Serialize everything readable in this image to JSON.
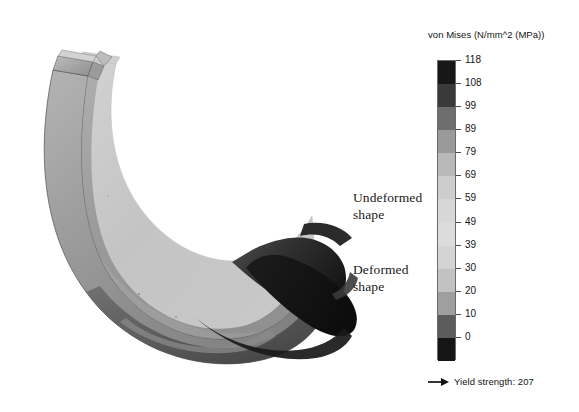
{
  "legend": {
    "title": "von Mises (N/mm^2 (MPa))",
    "scale_values": [
      "118",
      "108",
      "99",
      "89",
      "79",
      "69",
      "59",
      "49",
      "39",
      "30",
      "20",
      "10",
      "0"
    ],
    "band_colors": [
      "#171717",
      "#3a3a3a",
      "#6e6e6e",
      "#9a9a9a",
      "#b9b9b9",
      "#cdcdcd",
      "#d7d7d7",
      "#dcdcdc",
      "#d4d4d4",
      "#c2c2c2",
      "#9f9f9f",
      "#5c5c5c",
      "#151515"
    ],
    "yield": {
      "label": "Yield strength: 207",
      "arrow_icon": "right-arrow-icon"
    }
  },
  "annotations": {
    "undeformed": "Undeformed\nshape",
    "deformed": "Deformed\nshape"
  },
  "model": {
    "title": "fea-stress-plot",
    "undeformed_outline_color": "#8f8f8f",
    "deformed_body_fill": "#b4b4b4",
    "deformed_hot_zone": "#141414"
  },
  "chart_data": {
    "type": "heatmap",
    "title": "von Mises (N/mm^2 (MPa))",
    "xlabel": "",
    "ylabel": "",
    "colorbar_label": "von Mises (N/mm^2 (MPa))",
    "tick_labels": [
      "118",
      "108",
      "99",
      "89",
      "79",
      "69",
      "59",
      "49",
      "39",
      "30",
      "20",
      "10",
      "0"
    ],
    "values": [
      118,
      108,
      99,
      89,
      79,
      69,
      59,
      49,
      39,
      30,
      20,
      10,
      0
    ],
    "vmin": 0,
    "vmax": 118,
    "units": "N/mm^2 (MPa)",
    "reference_lines": [
      {
        "name": "Yield strength",
        "value": 207
      }
    ],
    "legend_position": "right",
    "grid": false,
    "annotations": [
      "Undeformed shape",
      "Deformed shape"
    ]
  }
}
